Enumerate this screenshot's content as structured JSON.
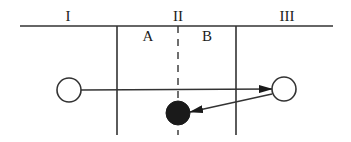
{
  "diagram": {
    "type": "collision-regions",
    "region_labels": [
      {
        "id": "I",
        "text": "I",
        "x": 68,
        "y": 21
      },
      {
        "id": "II",
        "text": "II",
        "x": 178,
        "y": 21
      },
      {
        "id": "III",
        "text": "III",
        "x": 287,
        "y": 21
      }
    ],
    "subregion_labels": [
      {
        "id": "A",
        "text": "A",
        "x": 148,
        "y": 41
      },
      {
        "id": "B",
        "text": "B",
        "x": 207,
        "y": 41
      }
    ],
    "lines": {
      "top_horizontal": {
        "x1": 20,
        "y1": 26,
        "x2": 333,
        "y2": 26
      },
      "left_boundary": {
        "x1": 117,
        "y1": 26,
        "x2": 117,
        "y2": 135
      },
      "right_boundary": {
        "x1": 236,
        "y1": 26,
        "x2": 236,
        "y2": 135
      },
      "center_dashed": {
        "x1": 178,
        "y1": 26,
        "x2": 178,
        "y2": 135
      }
    },
    "particles": [
      {
        "id": "initial",
        "style": "open",
        "cx": 69,
        "cy": 90,
        "r": 12
      },
      {
        "id": "turning",
        "style": "open",
        "cx": 284,
        "cy": 89,
        "r": 12
      },
      {
        "id": "final",
        "style": "filled",
        "cx": 178,
        "cy": 113,
        "r": 12
      }
    ],
    "arrows": [
      {
        "id": "forward",
        "x1": 81,
        "y1": 90,
        "x2": 272,
        "y2": 89
      },
      {
        "id": "return",
        "x1": 272,
        "y1": 94,
        "x2": 190,
        "y2": 112
      }
    ],
    "colors": {
      "stroke": "#333333",
      "fill_dark": "#1a1a1a",
      "background": "#ffffff"
    }
  }
}
